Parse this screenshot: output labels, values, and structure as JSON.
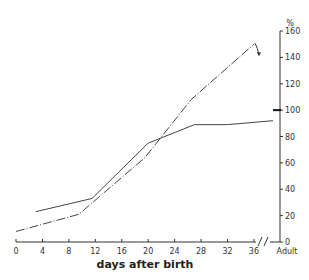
{
  "chart_data": {
    "type": "line",
    "title": "",
    "xlabel": "days after birth",
    "ylabel": "%",
    "x_ticks": [
      "0",
      "4",
      "8",
      "12",
      "16",
      "20",
      "24",
      "28",
      "32",
      "36",
      "Adult"
    ],
    "y_ticks": [
      "0",
      "20",
      "40",
      "60",
      "80",
      "100",
      "120",
      "140",
      "160"
    ],
    "xlim": [
      0,
      36
    ],
    "ylim": [
      0,
      160
    ],
    "y_axis_position": "right",
    "grid": false,
    "legend": null,
    "annotations": [
      "axis break between 36 and Adult",
      "bold reference mark at 100%",
      "arrow at end of dash-dot series pointing down"
    ],
    "series": [
      {
        "name": "solid",
        "style": "solid",
        "points": [
          [
            3,
            23
          ],
          [
            11.5,
            33
          ],
          [
            20,
            75
          ],
          [
            27,
            89
          ],
          [
            32,
            89
          ],
          [
            "Adult",
            92
          ]
        ]
      },
      {
        "name": "dash-dot",
        "style": "dash-dot",
        "points": [
          [
            0,
            8
          ],
          [
            9.5,
            21
          ],
          [
            19.5,
            64
          ],
          [
            26.5,
            108
          ],
          [
            36,
            150
          ]
        ]
      }
    ]
  }
}
